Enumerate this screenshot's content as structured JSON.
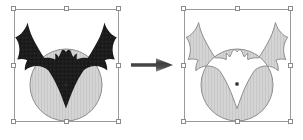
{
  "canvas": {
    "width": 303,
    "height": 140,
    "background": "#ffffff"
  },
  "colors": {
    "bat_fill": "#1c1c1c",
    "circle_fill": "#d2d2d2",
    "circle_stroke": "#8d8d8d",
    "result_fill": "#d2d2d2",
    "result_stroke": "#8d8d8d",
    "selection_stroke": "#9a9a9a",
    "handle_fill": "#ffffff",
    "handle_stroke": "#8a8a8a",
    "arrow_fill": "#4a4a4a",
    "center_mark": "#2b2b2b"
  },
  "left_figure": {
    "label": "before-shapes",
    "description": "Black bat silhouette overlapping a light gray circle, both selected",
    "selection": {
      "x": 14,
      "y": 9,
      "width": 105,
      "height": 113
    },
    "handles": [
      "nw",
      "n",
      "ne",
      "w",
      "e",
      "sw",
      "s",
      "se"
    ],
    "shapes": [
      {
        "name": "circle",
        "fill": "#d2d2d2",
        "stroke": "#8d8d8d"
      },
      {
        "name": "bat",
        "fill": "#1c1c1c",
        "stroke": "none"
      }
    ],
    "center_mark": {
      "x": 66,
      "y": 86
    }
  },
  "arrow": {
    "label": "transform-arrow",
    "direction": "right",
    "x": 131,
    "y": 57,
    "width": 42,
    "height": 16,
    "fill": "#4a4a4a"
  },
  "right_figure": {
    "label": "after-shape",
    "description": "Exclusive-or (exclude overlap) result: single light gray compound path of bat and circle",
    "selection": {
      "x": 184,
      "y": 9,
      "width": 107,
      "height": 113
    },
    "handles": [
      "nw",
      "n",
      "ne",
      "w",
      "e",
      "sw",
      "s",
      "se"
    ],
    "shapes": [
      {
        "name": "xor-result",
        "fill": "#d2d2d2",
        "stroke": "#8d8d8d"
      }
    ],
    "center_mark": {
      "x": 237,
      "y": 84
    }
  }
}
